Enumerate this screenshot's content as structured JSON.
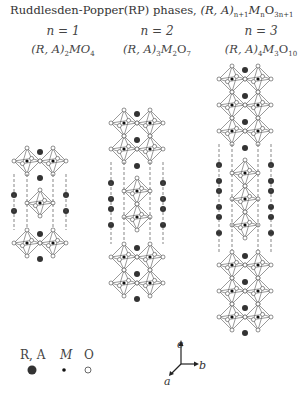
{
  "title": {
    "prefix": "Ruddlesden-Popper(RP) phases, ",
    "formula": "(R, A)",
    "sub1": "n+1",
    "m": "M",
    "sub2": "n",
    "o": "O",
    "sub3": "3n+1"
  },
  "structures": [
    {
      "n_label": "n = 1",
      "formula_head": "(R, A)",
      "formula_sub": "2",
      "formula_tail": "MO",
      "formula_sub2": "4",
      "layers": 1
    },
    {
      "n_label": "n = 2",
      "formula_head": "(R, A)",
      "formula_sub": "3",
      "formula_tail": "M",
      "formula_sub2": "2",
      "formula_tail2": "O",
      "formula_sub3": "7",
      "layers": 2
    },
    {
      "n_label": "n = 3",
      "formula_head": "(R, A)",
      "formula_sub": "4",
      "formula_tail": "M",
      "formula_sub2": "3",
      "formula_tail2": "O",
      "formula_sub3": "10",
      "layers": 3
    }
  ],
  "legend": [
    {
      "label": "R, A",
      "kind": "large-dark-atom"
    },
    {
      "label": "M",
      "kind": "small-black-atom"
    },
    {
      "label": "O",
      "kind": "open-circle-atom"
    }
  ],
  "axes": {
    "c": "c",
    "b": "b",
    "a": "a"
  }
}
